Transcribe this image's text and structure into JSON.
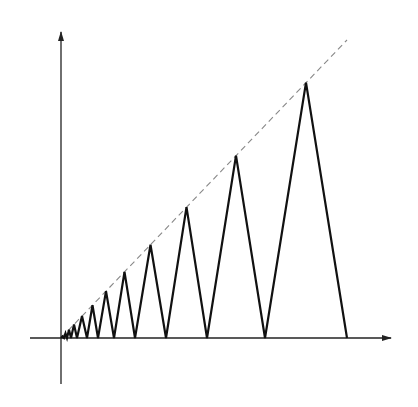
{
  "diagram": {
    "colors": {
      "background": "#ffffff",
      "axis": "#222222",
      "wave": "#111111",
      "envelope": "#888888"
    },
    "origin": [
      61,
      338
    ],
    "x_axis": {
      "from": [
        30,
        338
      ],
      "to": [
        391,
        338
      ]
    },
    "y_axis": {
      "from": [
        61,
        384
      ],
      "to": [
        61,
        32
      ]
    },
    "envelope_line": {
      "from": [
        61,
        338
      ],
      "to": [
        347,
        40
      ],
      "style": "dashed"
    },
    "valleys_x": [
      61,
      64,
      67,
      71,
      77,
      87,
      98,
      114,
      135,
      166,
      207,
      265,
      347
    ]
  }
}
